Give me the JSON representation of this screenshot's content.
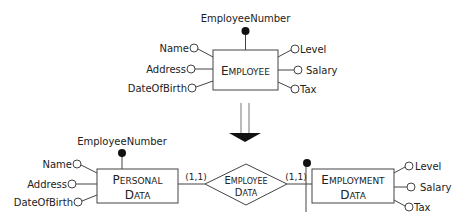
{
  "top": {
    "entity": {
      "first": "E",
      "rest": "MPLOYEE"
    },
    "identifier": "EmployeeNumber",
    "left_attributes": [
      "Name",
      "Address",
      "DateOfBirth"
    ],
    "right_attributes": [
      "Level",
      "Salary",
      "Tax"
    ]
  },
  "transform_arrow": "down-arrow",
  "bottom": {
    "personal": {
      "line1_first": "P",
      "line1_rest": "ERSONAL",
      "line2_first": "D",
      "line2_rest": "ATA",
      "identifier": "EmployeeNumber",
      "attributes": [
        "Name",
        "Address",
        "DateOfBirth"
      ]
    },
    "relationship": {
      "line1_first": "E",
      "line1_rest": "MPLOYEE",
      "line2_first": "D",
      "line2_rest": "ATA",
      "card_left": "(1,1)",
      "card_right": "(1,1)"
    },
    "employment": {
      "line1_first": "E",
      "line1_rest": "MPLOYMENT",
      "line2_first": "D",
      "line2_rest": "ATA",
      "attributes": [
        "Level",
        "Salary",
        "Tax"
      ]
    }
  }
}
